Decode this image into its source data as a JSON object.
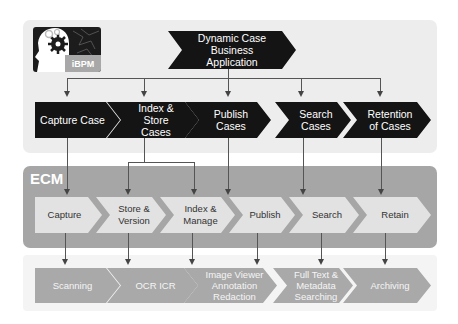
{
  "logo": {
    "label": "iBPM",
    "icon": "head-with-gear-icon"
  },
  "top_section": {
    "source": {
      "label": "Dynamic Case Business Application"
    },
    "steps": [
      {
        "label": "Capture Case"
      },
      {
        "label": "Index & Store Cases"
      },
      {
        "label": "Publish Cases"
      },
      {
        "label": "Search Cases"
      },
      {
        "label": "Retention of Cases"
      }
    ]
  },
  "ecm_section": {
    "title": "ECM",
    "steps": [
      {
        "label": "Capture"
      },
      {
        "label": "Store & Version"
      },
      {
        "label": "Index & Manage"
      },
      {
        "label": "Publish"
      },
      {
        "label": "Search"
      },
      {
        "label": "Retain"
      }
    ]
  },
  "bottom_section": {
    "steps": [
      {
        "label": "Scanning"
      },
      {
        "label": "OCR ICR"
      },
      {
        "label": "Image Viewer Annotation Redaction"
      },
      {
        "label": "Full Text & Metadata Searching"
      },
      {
        "label": "Archiving"
      }
    ]
  },
  "colors": {
    "top_panel": "#ededed",
    "ecm_panel": "#a6a6a6",
    "black_chevron": "#141414",
    "light_chevron": "#e2e2e2",
    "mid_chevron": "#a9a9a9",
    "connector": "#555555"
  }
}
